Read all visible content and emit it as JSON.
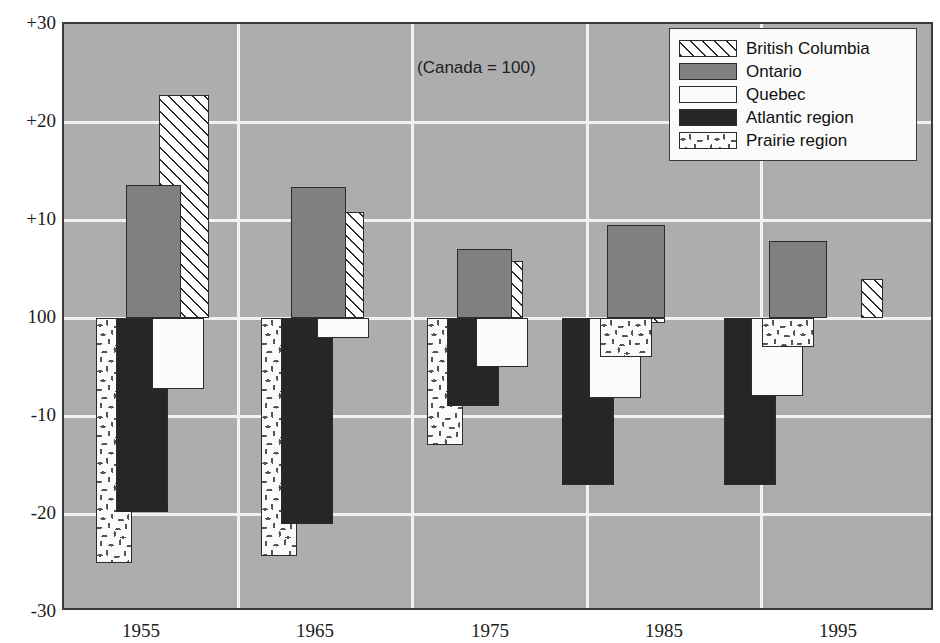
{
  "annotation": "(Canada = 100)",
  "legend": {
    "position": "top-right",
    "items": [
      {
        "label": "British Columbia",
        "key": "bc",
        "swatch": "diagonal-hatch"
      },
      {
        "label": "Ontario",
        "key": "ontario",
        "swatch": "solid-gray"
      },
      {
        "label": "Quebec",
        "key": "quebec",
        "swatch": "solid-white"
      },
      {
        "label": "Atlantic region",
        "key": "atlantic",
        "swatch": "solid-black"
      },
      {
        "label": "Prairie region",
        "key": "prairie",
        "swatch": "speckled-white"
      }
    ]
  },
  "yaxis": {
    "ticks": [
      "+30",
      "+20",
      "+10",
      "100",
      "-10",
      "-20",
      "-30"
    ],
    "values": [
      30,
      20,
      10,
      0,
      -10,
      -20,
      -30
    ]
  },
  "colors": {
    "panel_background": "#adadad",
    "gridline": "#f2f2f2",
    "ontario": "#808080",
    "quebec": "#fbfbfb",
    "atlantic": "#262626",
    "bc_hatch": "#2b2b2b",
    "prairie": "#fbfbfb",
    "outline": "#2b2b2b",
    "frame": "#3a3a3a"
  },
  "chart_data": {
    "type": "bar",
    "title": "",
    "subtitle": "",
    "xlabel": "",
    "ylabel": "",
    "annotation": "(Canada = 100)",
    "ylim": [
      -30,
      30
    ],
    "grid": true,
    "legend_position": "top-right",
    "note": "Values are index points relative to Canada = 100 (baseline 0 on the axis).",
    "categories": [
      "1955",
      "1965",
      "1975",
      "1985",
      "1995"
    ],
    "series": [
      {
        "name": "British Columbia",
        "values": [
          22.8,
          10.8,
          5.8,
          -0.5,
          4.0
        ]
      },
      {
        "name": "Ontario",
        "values": [
          13.6,
          13.4,
          7.0,
          9.5,
          7.9
        ]
      },
      {
        "name": "Quebec",
        "values": [
          -7.2,
          -2.0,
          -5.0,
          -8.2,
          -8.0
        ]
      },
      {
        "name": "Atlantic region",
        "values": [
          -19.8,
          -21.0,
          -9.0,
          -17.0,
          -17.0
        ]
      },
      {
        "name": "Prairie region",
        "values": [
          -25.0,
          -24.3,
          -13.0,
          -4.0,
          -3.0
        ]
      }
    ]
  },
  "bars": [
    {
      "group": "1955",
      "series": "Prairie region",
      "cls": "s-prairie",
      "value": -25.0,
      "x": 32,
      "w": 36,
      "z": 1
    },
    {
      "group": "1955",
      "series": "Atlantic region",
      "cls": "s-atlantic",
      "value": -19.8,
      "x": 52,
      "w": 52,
      "z": 2
    },
    {
      "group": "1955",
      "series": "Quebec",
      "cls": "s-quebec",
      "value": -7.2,
      "x": 88,
      "w": 52,
      "z": 3
    },
    {
      "group": "1955",
      "series": "British Columbia",
      "cls": "s-bc",
      "value": 22.8,
      "x": 95,
      "w": 50,
      "z": 4
    },
    {
      "group": "1955",
      "series": "Ontario",
      "cls": "s-ontario",
      "value": 13.6,
      "x": 62,
      "w": 55,
      "z": 5
    },
    {
      "group": "1965",
      "series": "Prairie region",
      "cls": "s-prairie",
      "value": -24.3,
      "x": 197,
      "w": 36,
      "z": 1
    },
    {
      "group": "1965",
      "series": "Atlantic region",
      "cls": "s-atlantic",
      "value": -21.0,
      "x": 217,
      "w": 52,
      "z": 2
    },
    {
      "group": "1965",
      "series": "Quebec",
      "cls": "s-quebec",
      "value": -2.0,
      "x": 253,
      "w": 52,
      "z": 3
    },
    {
      "group": "1965",
      "series": "British Columbia",
      "cls": "s-bc",
      "value": 10.8,
      "x": 265,
      "w": 35,
      "z": 4
    },
    {
      "group": "1965",
      "series": "Ontario",
      "cls": "s-ontario",
      "value": 13.4,
      "x": 227,
      "w": 55,
      "z": 5
    },
    {
      "group": "1975",
      "series": "Prairie region",
      "cls": "s-prairie",
      "value": -13.0,
      "x": 363,
      "w": 36,
      "z": 1
    },
    {
      "group": "1975",
      "series": "Atlantic region",
      "cls": "s-atlantic",
      "value": -9.0,
      "x": 383,
      "w": 52,
      "z": 2
    },
    {
      "group": "1975",
      "series": "Quebec",
      "cls": "s-quebec",
      "value": -5.0,
      "x": 412,
      "w": 52,
      "z": 3
    },
    {
      "group": "1975",
      "series": "British Columbia",
      "cls": "s-bc",
      "value": 5.8,
      "x": 431,
      "w": 28,
      "z": 4
    },
    {
      "group": "1975",
      "series": "Ontario",
      "cls": "s-ontario",
      "value": 7.0,
      "x": 393,
      "w": 55,
      "z": 5
    },
    {
      "group": "1985",
      "series": "Atlantic region",
      "cls": "s-atlantic",
      "value": -17.0,
      "x": 498,
      "w": 52,
      "z": 1
    },
    {
      "group": "1985",
      "series": "Quebec",
      "cls": "s-quebec",
      "value": -8.2,
      "x": 525,
      "w": 52,
      "z": 2
    },
    {
      "group": "1985",
      "series": "British Columbia",
      "cls": "s-bc",
      "value": -0.5,
      "x": 543,
      "w": 58,
      "z": 3
    },
    {
      "group": "1985",
      "series": "Prairie region",
      "cls": "s-prairie",
      "value": -4.0,
      "x": 536,
      "w": 52,
      "z": 4
    },
    {
      "group": "1985",
      "series": "Ontario",
      "cls": "s-ontario",
      "value": 9.5,
      "x": 543,
      "w": 58,
      "z": 5
    },
    {
      "group": "1995",
      "series": "Atlantic region",
      "cls": "s-atlantic",
      "value": -17.0,
      "x": 660,
      "w": 52,
      "z": 1
    },
    {
      "group": "1995",
      "series": "Quebec",
      "cls": "s-quebec",
      "value": -8.0,
      "x": 687,
      "w": 52,
      "z": 2
    },
    {
      "group": "1995",
      "series": "Prairie region",
      "cls": "s-prairie",
      "value": -3.0,
      "x": 698,
      "w": 52,
      "z": 3
    },
    {
      "group": "1995",
      "series": "British Columbia",
      "cls": "s-bc",
      "value": 4.0,
      "x": 797,
      "w": 22,
      "z": 4
    },
    {
      "group": "1995",
      "series": "Ontario",
      "cls": "s-ontario",
      "value": 7.9,
      "x": 705,
      "w": 58,
      "z": 5
    }
  ],
  "xaxis": {
    "labels": [
      "1955",
      "1965",
      "1975",
      "1985",
      "1995"
    ],
    "positions": [
      79,
      253,
      428,
      602,
      776
    ]
  }
}
